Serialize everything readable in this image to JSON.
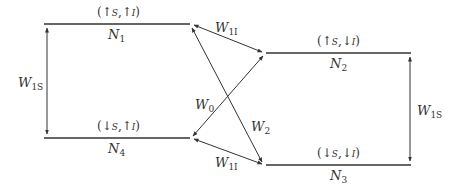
{
  "diagram": {
    "type": "energy-level transition diagram",
    "levels": [
      {
        "id": "N1",
        "name": "N",
        "sub": "1",
        "state": "(↑S,↑I)",
        "state_parts": [
          "(↑",
          "S",
          ",↑",
          "I",
          ")"
        ]
      },
      {
        "id": "N2",
        "name": "N",
        "sub": "2",
        "state": "(↑S,↓I)",
        "state_parts": [
          "(↑",
          "S",
          ",↓",
          "I",
          ")"
        ]
      },
      {
        "id": "N3",
        "name": "N",
        "sub": "3",
        "state": "(↓S,↓I)",
        "state_parts": [
          "(↓",
          "S",
          ",↓",
          "I",
          ")"
        ]
      },
      {
        "id": "N4",
        "name": "N",
        "sub": "4",
        "state": "(↓S,↑I)",
        "state_parts": [
          "(↓",
          "S",
          ",↑",
          "I",
          ")"
        ]
      }
    ],
    "transitions": [
      {
        "id": "W1S_left",
        "from": "N1",
        "to": "N4",
        "name": "W",
        "sub": "1S"
      },
      {
        "id": "W1S_right",
        "from": "N2",
        "to": "N3",
        "name": "W",
        "sub": "1S"
      },
      {
        "id": "W1I_top",
        "from": "N1",
        "to": "N2",
        "name": "W",
        "sub": "1I"
      },
      {
        "id": "W1I_bottom",
        "from": "N4",
        "to": "N3",
        "name": "W",
        "sub": "1I"
      },
      {
        "id": "W0",
        "from": "N2",
        "to": "N4",
        "name": "W",
        "sub": "0"
      },
      {
        "id": "W2",
        "from": "N1",
        "to": "N3",
        "name": "W",
        "sub": "2"
      }
    ],
    "line_color": "#333333"
  }
}
